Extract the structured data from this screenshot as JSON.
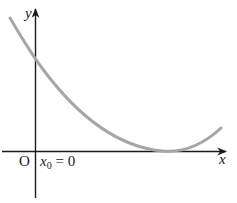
{
  "diagram": {
    "type": "function-graph",
    "axes": {
      "x_label": "x",
      "y_label": "y",
      "origin_label": "O"
    },
    "annotation": {
      "var": "x",
      "subscript": "0",
      "rest": " = 0"
    },
    "curve": {
      "shape": "parabola-like, decreasing then touching x-axis at minimum then increasing",
      "color": "#a6a6a6"
    },
    "colors": {
      "axis": "#1a1a1a",
      "curve": "#a6a6a6"
    }
  }
}
